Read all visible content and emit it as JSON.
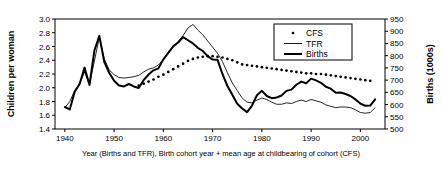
{
  "chart_data": {
    "type": "line",
    "title": "",
    "xlabel": "Year (Births and TFR), Birth cohort year + mean age at childbearing of cohort (CFS)",
    "ylabel": "Children per woman",
    "ylabel_right": "Births (1000s)",
    "xlim": [
      1938,
      2005
    ],
    "ylim": [
      1.4,
      3.0
    ],
    "ylim_right": [
      500,
      950
    ],
    "grid": false,
    "legend_position": "top-right",
    "xticks": [
      1940,
      1950,
      1960,
      1970,
      1980,
      1990,
      2000
    ],
    "xtick_labels": [
      "1940",
      "1950",
      "1960",
      "1970",
      "1980",
      "1990",
      "2000"
    ],
    "yticks": [
      1.4,
      1.6,
      1.8,
      2.0,
      2.2,
      2.4,
      2.6,
      2.8,
      3.0
    ],
    "ytick_labels": [
      "1.4",
      "1.6",
      "1.8",
      "2.0",
      "2.2",
      "2.4",
      "2.6",
      "2.8",
      "3.0"
    ],
    "yticks_right": [
      500,
      550,
      600,
      650,
      700,
      750,
      800,
      850,
      900,
      950
    ],
    "ytick_labels_right": [
      "500",
      "550",
      "600",
      "650",
      "700",
      "750",
      "800",
      "850",
      "900",
      "950"
    ],
    "series": [
      {
        "name": "CFS",
        "style": "dotted",
        "axis": "left",
        "x": [
          1955,
          1956,
          1957,
          1958,
          1959,
          1960,
          1961,
          1962,
          1963,
          1964,
          1965,
          1966,
          1967,
          1968,
          1969,
          1970,
          1971,
          1972,
          1973,
          1974,
          1975,
          1976,
          1977,
          1978,
          1979,
          1980,
          1981,
          1982,
          1983,
          1984,
          1985,
          1986,
          1987,
          1988,
          1989,
          1990,
          1991,
          1992,
          1993,
          1994,
          1995,
          1996,
          1997,
          1998,
          1999,
          2000,
          2001,
          2002
        ],
        "y": [
          2.03,
          2.06,
          2.09,
          2.12,
          2.16,
          2.19,
          2.23,
          2.27,
          2.31,
          2.35,
          2.39,
          2.42,
          2.44,
          2.45,
          2.46,
          2.46,
          2.45,
          2.44,
          2.42,
          2.4,
          2.37,
          2.34,
          2.33,
          2.32,
          2.31,
          2.3,
          2.29,
          2.28,
          2.27,
          2.26,
          2.25,
          2.24,
          2.23,
          2.22,
          2.21,
          2.21,
          2.2,
          2.2,
          2.19,
          2.18,
          2.17,
          2.16,
          2.15,
          2.14,
          2.13,
          2.12,
          2.11,
          2.1
        ]
      },
      {
        "name": "TFR",
        "style": "thin",
        "axis": "left",
        "x": [
          1940,
          1941,
          1942,
          1943,
          1944,
          1945,
          1946,
          1947,
          1948,
          1949,
          1950,
          1951,
          1952,
          1953,
          1954,
          1955,
          1956,
          1957,
          1958,
          1959,
          1960,
          1961,
          1962,
          1963,
          1964,
          1965,
          1966,
          1967,
          1968,
          1969,
          1970,
          1971,
          1972,
          1973,
          1974,
          1975,
          1976,
          1977,
          1978,
          1979,
          1980,
          1981,
          1982,
          1983,
          1984,
          1985,
          1986,
          1987,
          1988,
          1989,
          1990,
          1991,
          1992,
          1993,
          1994,
          1995,
          1996,
          1997,
          1998,
          1999,
          2000,
          2001,
          2002,
          2003
        ],
        "y": [
          1.71,
          1.8,
          1.96,
          2.06,
          2.23,
          2.05,
          2.39,
          2.73,
          2.42,
          2.26,
          2.19,
          2.15,
          2.14,
          2.15,
          2.16,
          2.18,
          2.23,
          2.27,
          2.29,
          2.33,
          2.41,
          2.52,
          2.6,
          2.67,
          2.76,
          2.87,
          2.92,
          2.84,
          2.77,
          2.68,
          2.59,
          2.5,
          2.38,
          2.22,
          2.07,
          1.96,
          1.85,
          1.79,
          1.78,
          1.82,
          1.85,
          1.83,
          1.79,
          1.76,
          1.76,
          1.78,
          1.77,
          1.8,
          1.82,
          1.8,
          1.83,
          1.81,
          1.79,
          1.75,
          1.73,
          1.71,
          1.72,
          1.72,
          1.71,
          1.68,
          1.64,
          1.63,
          1.64,
          1.71
        ]
      },
      {
        "name": "Births",
        "style": "thick",
        "axis": "right",
        "x": [
          1940,
          1941,
          1942,
          1943,
          1944,
          1945,
          1946,
          1947,
          1948,
          1949,
          1950,
          1951,
          1952,
          1953,
          1954,
          1955,
          1956,
          1957,
          1958,
          1959,
          1960,
          1961,
          1962,
          1963,
          1964,
          1965,
          1966,
          1967,
          1968,
          1969,
          1970,
          1971,
          1972,
          1973,
          1974,
          1975,
          1976,
          1977,
          1978,
          1979,
          1980,
          1981,
          1982,
          1983,
          1984,
          1985,
          1986,
          1987,
          1988,
          1989,
          1990,
          1991,
          1992,
          1993,
          1994,
          1995,
          1996,
          1997,
          1998,
          1999,
          2000,
          2001,
          2002,
          2003
        ],
        "y": [
          590,
          580,
          652,
          684,
          751,
          680,
          821,
          881,
          775,
          730,
          697,
          678,
          674,
          684,
          674,
          668,
          700,
          723,
          740,
          748,
          785,
          811,
          838,
          854,
          876,
          863,
          850,
          832,
          819,
          798,
          784,
          783,
          725,
          676,
          640,
          603,
          584,
          569,
          596,
          638,
          656,
          635,
          626,
          629,
          637,
          656,
          661,
          681,
          694,
          687,
          706,
          699,
          689,
          673,
          665,
          648,
          649,
          643,
          635,
          621,
          604,
          595,
          596,
          621
        ]
      }
    ],
    "legend": [
      {
        "label": "CFS",
        "style": "dotted"
      },
      {
        "label": "TFR",
        "style": "thin"
      },
      {
        "label": "Births",
        "style": "thick"
      }
    ]
  }
}
